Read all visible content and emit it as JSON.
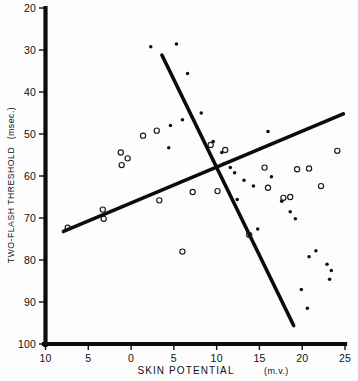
{
  "figure": {
    "background": "#fdfdfd",
    "ink_color": "#0b0b0b",
    "caption_partial": ""
  },
  "axes": {
    "y_title": "TWO-FLASH THRESHOLD",
    "y_unit": "(msec.)",
    "x_title": "SKIN  POTENTIAL",
    "x_unit": "(m.v.)",
    "x_tick_labels": [
      "10",
      "5",
      "0",
      "5",
      "10",
      "15",
      "20",
      "25"
    ],
    "y_tick_labels": [
      "20",
      "30",
      "40",
      "50",
      "60",
      "70",
      "80",
      "90",
      "100"
    ]
  },
  "chart_data": {
    "type": "scatter",
    "title": "",
    "xlabel": "SKIN POTENTIAL (m.v.)",
    "ylabel": "TWO-FLASH THRESHOLD (msec.)",
    "grid": false,
    "legend": "none",
    "x_axis_values": [
      -10,
      -5,
      0,
      5,
      10,
      15,
      20,
      25
    ],
    "xlim": [
      -10,
      25
    ],
    "ylim": [
      20,
      100
    ],
    "y_axis_inverted": true,
    "series": [
      {
        "name": "filled-points",
        "marker": "filled-circle",
        "points": [
          [
            2.3,
            29.2
          ],
          [
            5.3,
            28.6
          ],
          [
            6.6,
            35.6
          ],
          [
            8.2,
            45.0
          ],
          [
            4.6,
            48.0
          ],
          [
            6.0,
            46.6
          ],
          [
            4.4,
            53.3
          ],
          [
            9.6,
            51.8
          ],
          [
            10.6,
            54.4
          ],
          [
            10.9,
            57.0
          ],
          [
            11.6,
            58.0
          ],
          [
            12.1,
            59.2
          ],
          [
            13.2,
            61.0
          ],
          [
            14.3,
            62.4
          ],
          [
            12.4,
            65.6
          ],
          [
            16.0,
            49.4
          ],
          [
            16.4,
            60.2
          ],
          [
            17.6,
            66.0
          ],
          [
            18.6,
            68.5
          ],
          [
            19.2,
            70.2
          ],
          [
            14.8,
            72.6
          ],
          [
            20.8,
            79.2
          ],
          [
            21.6,
            77.8
          ],
          [
            22.9,
            81.0
          ],
          [
            23.2,
            84.6
          ],
          [
            23.4,
            82.5
          ],
          [
            19.9,
            87.0
          ],
          [
            20.6,
            91.5
          ]
        ]
      },
      {
        "name": "open-points",
        "marker": "open-circle",
        "points": [
          [
            -7.4,
            72.3
          ],
          [
            -3.3,
            68.0
          ],
          [
            -3.2,
            70.2
          ],
          [
            -1.2,
            54.4
          ],
          [
            -1.1,
            57.4
          ],
          [
            -0.4,
            55.8
          ],
          [
            1.4,
            50.4
          ],
          [
            3.0,
            49.2
          ],
          [
            3.3,
            65.8
          ],
          [
            7.2,
            63.8
          ],
          [
            9.3,
            52.6
          ],
          [
            11.0,
            53.8
          ],
          [
            10.1,
            63.6
          ],
          [
            13.8,
            74.0
          ],
          [
            15.6,
            58.0
          ],
          [
            16.0,
            62.8
          ],
          [
            17.8,
            65.2
          ],
          [
            18.6,
            65.0
          ],
          [
            19.4,
            58.4
          ],
          [
            20.8,
            58.2
          ],
          [
            22.2,
            62.4
          ],
          [
            24.1,
            54.0
          ],
          [
            6.0,
            78.0
          ]
        ]
      }
    ],
    "fit_lines": [
      {
        "name": "descending-fit",
        "x_start": 3.6,
        "y_start": 31.2,
        "x_end": 19.0,
        "y_end": 95.6
      },
      {
        "name": "ascending-fit",
        "x_start": -7.9,
        "y_start": 73.2,
        "x_end": 24.8,
        "y_end": 45.2
      }
    ]
  }
}
